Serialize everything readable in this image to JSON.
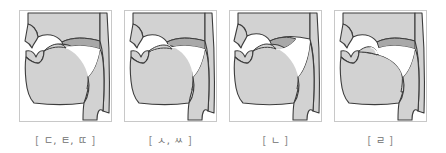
{
  "figure": {
    "panel_count": 4,
    "colors": {
      "tissue_fill": "#d2d2d2",
      "velum_fill": "#a8a8a8",
      "outline": "#3c3c3c",
      "airway_fill": "#ffffff",
      "panel_border": "#c8c8c8",
      "label_text": "#6e6e6e",
      "background": "#ffffff"
    }
  },
  "panels": [
    {
      "id": "panel-1",
      "label": "[ ㄷ, ㅌ, ㄸ ]",
      "open_bracket": "[",
      "close_bracket": "]",
      "letters": "ㄷ, ㅌ, ㄸ",
      "articulation": "alveolar-stop",
      "velum": "raised",
      "tongue_tip": "contacting-alveolar-ridge"
    },
    {
      "id": "panel-2",
      "label": "[ ㅅ, ㅆ ]",
      "open_bracket": "[",
      "close_bracket": "]",
      "letters": "ㅅ, ㅆ",
      "articulation": "alveolar-fricative",
      "velum": "raised",
      "tongue_tip": "narrow-groove-at-alveolar-ridge"
    },
    {
      "id": "panel-3",
      "label": "[ ㄴ ]",
      "open_bracket": "[",
      "close_bracket": "]",
      "letters": "ㄴ",
      "articulation": "alveolar-nasal",
      "velum": "lowered",
      "tongue_tip": "contacting-alveolar-ridge"
    },
    {
      "id": "panel-4",
      "label": "[ ㄹ ]",
      "open_bracket": "[",
      "close_bracket": "]",
      "letters": "ㄹ",
      "articulation": "alveolar-liquid",
      "velum": "raised",
      "tongue_tip": "curled-lateral"
    }
  ]
}
